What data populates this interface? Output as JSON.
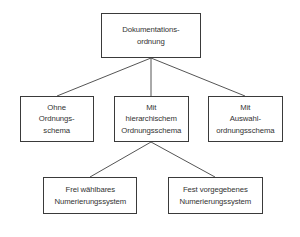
{
  "diagram": {
    "type": "hierarchy-tree",
    "language": "de",
    "colors": {
      "background": "#ffffff",
      "box_border": "#3a3a3a",
      "connector_line": "#555555",
      "text": "#333333"
    },
    "nodes": [
      {
        "id": "root",
        "label": "Dokumentations-\nordnung",
        "level": 1
      },
      {
        "id": "ohne",
        "label": "Ohne\nOrdnungs-\nschema",
        "level": 2
      },
      {
        "id": "hierarchisch",
        "label": "Mit\nhierarchischem\nOrdnungsschema",
        "level": 2
      },
      {
        "id": "auswahl",
        "label": "Mit\nAuswahl-\nordnungsschema",
        "level": 2
      },
      {
        "id": "frei",
        "label": "Frei wählbares\nNumerierungssystem",
        "level": 3
      },
      {
        "id": "fest",
        "label": "Fest vorgegebenes\nNumerierungssystem",
        "level": 3
      }
    ],
    "edges": [
      {
        "from": "root",
        "to": "ohne"
      },
      {
        "from": "root",
        "to": "hierarchisch"
      },
      {
        "from": "root",
        "to": "auswahl"
      },
      {
        "from": "hierarchisch",
        "to": "frei"
      },
      {
        "from": "hierarchisch",
        "to": "fest"
      }
    ]
  }
}
